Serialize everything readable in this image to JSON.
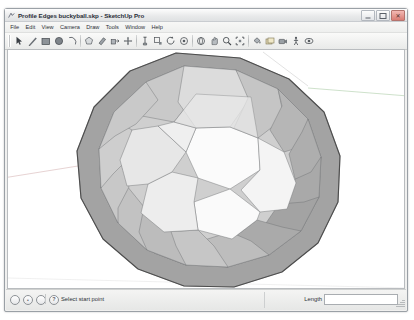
{
  "window": {
    "title": "Profile Edges buckyball.skp - SketchUp Pro",
    "app_icon": "sketchup-app-icon",
    "controls": {
      "minimize_label": "–",
      "maximize_label": "□",
      "close_label": "✕"
    }
  },
  "menubar": {
    "items": [
      {
        "label": "File"
      },
      {
        "label": "Edit"
      },
      {
        "label": "View"
      },
      {
        "label": "Camera"
      },
      {
        "label": "Draw"
      },
      {
        "label": "Tools"
      },
      {
        "label": "Window"
      },
      {
        "label": "Help"
      }
    ]
  },
  "toolbar": {
    "items": [
      {
        "icon": "select-arrow-icon"
      },
      {
        "icon": "line-pencil-icon"
      },
      {
        "icon": "rectangle-icon"
      },
      {
        "icon": "circle-icon"
      },
      {
        "icon": "arc-icon"
      },
      {
        "sep": true
      },
      {
        "icon": "polygon-icon"
      },
      {
        "icon": "eraser-icon"
      },
      {
        "icon": "push-pull-icon"
      },
      {
        "icon": "move-icon"
      },
      {
        "sep": true
      },
      {
        "icon": "tape-measure-icon"
      },
      {
        "icon": "scale-icon"
      },
      {
        "icon": "rotate-icon"
      },
      {
        "icon": "follow-me-icon"
      },
      {
        "sep": true
      },
      {
        "icon": "orbit-icon"
      },
      {
        "icon": "pan-icon"
      },
      {
        "icon": "zoom-icon"
      },
      {
        "icon": "zoom-extents-icon"
      },
      {
        "sep": true
      },
      {
        "icon": "paint-bucket-icon"
      },
      {
        "icon": "components-icon"
      },
      {
        "icon": "position-camera-icon"
      },
      {
        "icon": "walk-icon"
      },
      {
        "icon": "look-around-icon"
      }
    ]
  },
  "viewport": {
    "background_color": "#ffffff",
    "model_name": "buckyball",
    "axes": [
      {
        "name": "green-axis",
        "color": "#b9d4b5"
      },
      {
        "name": "red-axis",
        "color": "#ddc0c0"
      }
    ],
    "shading": {
      "face_front_light": "#fbfbfb",
      "face_mid": "#e3e3e3",
      "face_rim": "#bcbcbc",
      "face_rim_dark": "#a8a8a8",
      "face_shadow": "#9a9a9a",
      "profile_edge_color": "#4d4d4d"
    }
  },
  "statusbar": {
    "icons": [
      {
        "name": "status-circle-1",
        "glyph": ""
      },
      {
        "name": "status-circle-2",
        "glyph": "•"
      },
      {
        "name": "status-circle-3",
        "glyph": ""
      }
    ],
    "help_icon_label": "?",
    "prompt": "Select start point",
    "measurement_label": "Length",
    "measurement_value": "",
    "measurement_placeholder": ""
  }
}
